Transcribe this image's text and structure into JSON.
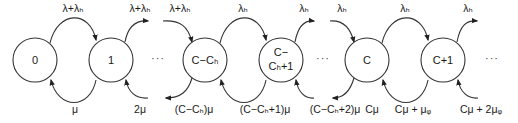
{
  "diagram": {
    "type": "birth-death Markov chain",
    "states": [
      {
        "id": "s0",
        "label": "0",
        "cx": 35
      },
      {
        "id": "s1",
        "label": "1",
        "cx": 111
      },
      {
        "id": "sCCh",
        "label": "C−Cₕ",
        "cx": 205
      },
      {
        "id": "sCCh1",
        "label_line1": "C−",
        "label_line2": "Cₕ+1",
        "cx": 281
      },
      {
        "id": "sC",
        "label": "C",
        "cx": 367
      },
      {
        "id": "sC1",
        "label": "C+1",
        "cx": 443
      }
    ],
    "ellipses": [
      "···",
      "···",
      "···"
    ],
    "forward_rates": [
      "λ+λₕ",
      "λ+λₕ",
      "λ+λₕ",
      "λₕ",
      "λₕ",
      "λₕ",
      "λₕ",
      "λₕ"
    ],
    "backward_rates": [
      "μ",
      "2μ",
      "(C−Cₕ)μ",
      "(C−Cₕ+1)μ",
      "(C−Cₕ+2)μ",
      "Cμ",
      "Cμ + μᵩ",
      "Cμ + 2μᵩ"
    ]
  }
}
